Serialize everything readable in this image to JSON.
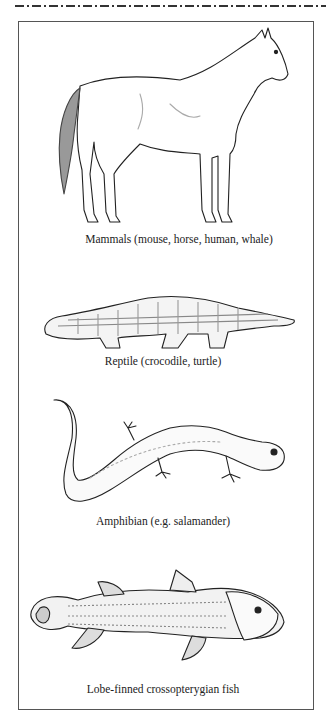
{
  "figure": {
    "panels": [
      {
        "animal": "horse",
        "caption": "Mammals  (mouse, horse, human, whale)"
      },
      {
        "animal": "crocodile",
        "caption": "Reptile (crocodile, turtle)"
      },
      {
        "animal": "salamander",
        "caption": "Amphibian (e.g. salamander)"
      },
      {
        "animal": "coelacanth",
        "caption": "Lobe-finned crossopterygian fish"
      }
    ]
  }
}
